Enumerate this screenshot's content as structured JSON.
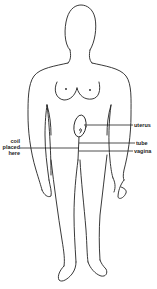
{
  "diagram": {
    "labels": {
      "uterus": "uterus",
      "tube": "tube",
      "vagina": "vagina",
      "coil_line1": "coil",
      "coil_line2": "placed",
      "coil_line3": "here"
    },
    "colors": {
      "line": "#222222",
      "background": "#ffffff"
    }
  }
}
